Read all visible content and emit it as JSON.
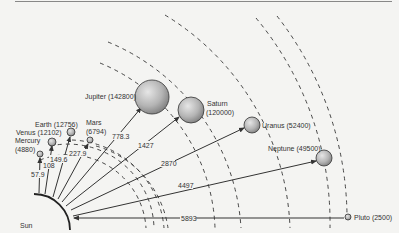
{
  "diagram": {
    "sun_label": "Sun",
    "colors": {
      "background": "#f4f4f2",
      "line": "#333333",
      "planet_light": "#d9d9d9",
      "planet_dark": "#8a8a8a",
      "top_rule": "#888888"
    },
    "planets": [
      {
        "name": "Mercury",
        "label": "Mercury\n(4880)",
        "label_line1": "Mercury",
        "label_line2": "(4880)",
        "diameter_km": 4880,
        "distance": "57.9"
      },
      {
        "name": "Venus",
        "label": "Venus (12102)",
        "diameter_km": 12102,
        "distance": "108"
      },
      {
        "name": "Earth",
        "label": "Earth (12756)",
        "diameter_km": 12756,
        "distance": "149.6"
      },
      {
        "name": "Mars",
        "label_line1": "Mars",
        "label_line2": "(6794)",
        "diameter_km": 6794,
        "distance": "227.9"
      },
      {
        "name": "Jupiter",
        "label": "Jupiter (142800)",
        "diameter_km": 142800,
        "distance": "778.3"
      },
      {
        "name": "Saturn",
        "label_line1": "Saturn",
        "label_line2": "(120000)",
        "diameter_km": 120000,
        "distance": "1427"
      },
      {
        "name": "Uranus",
        "label": "Uranus (52400)",
        "diameter_km": 52400,
        "distance": "2870"
      },
      {
        "name": "Neptune",
        "label": "Neptune (49500)",
        "diameter_km": 49500,
        "distance": "4497"
      },
      {
        "name": "Pluto",
        "label": "Pluto (2500)",
        "diameter_km": 2500,
        "distance": "5893"
      }
    ]
  }
}
